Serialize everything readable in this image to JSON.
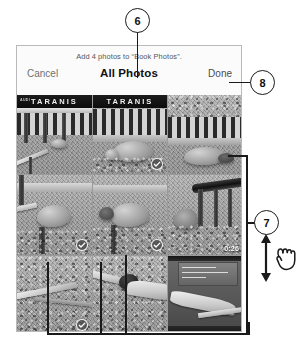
{
  "panel": {
    "nav": {
      "subtitle": "Add 4 photos to “Book Photos”.",
      "title": "All Photos",
      "cancel_label": "Cancel",
      "done_label": "Done"
    },
    "grid": {
      "rows": 3,
      "columns": 3,
      "cells": [
        {
          "id": "cell-1",
          "kind": "photo",
          "banner_text": "TARANIS",
          "banner_small": "AUDI",
          "selected": false,
          "duration": null
        },
        {
          "id": "cell-2",
          "kind": "photo",
          "banner_text": "TARANIS",
          "banner_small": "",
          "selected": true,
          "duration": null
        },
        {
          "id": "cell-3",
          "kind": "photo",
          "banner_text": "",
          "banner_small": "",
          "selected": false,
          "duration": null
        },
        {
          "id": "cell-4",
          "kind": "photo",
          "banner_text": "",
          "banner_small": "",
          "selected": true,
          "duration": null
        },
        {
          "id": "cell-5",
          "kind": "photo",
          "banner_text": "",
          "banner_small": "",
          "selected": true,
          "duration": null
        },
        {
          "id": "cell-6",
          "kind": "video",
          "banner_text": "",
          "banner_small": "",
          "selected": false,
          "duration": "0:26"
        },
        {
          "id": "cell-7",
          "kind": "photo",
          "banner_text": "",
          "banner_small": "",
          "selected": true,
          "duration": null
        },
        {
          "id": "cell-8",
          "kind": "photo",
          "banner_text": "",
          "banner_small": "",
          "selected": false,
          "duration": null
        },
        {
          "id": "cell-9",
          "kind": "photo",
          "banner_text": "",
          "banner_small": "",
          "selected": false,
          "duration": null
        }
      ]
    }
  },
  "annotations": {
    "callouts": [
      {
        "id": "callout-6",
        "label": "6",
        "target": "all-photos-title"
      },
      {
        "id": "callout-7",
        "label": "7",
        "target": "photo-grid-scroll"
      },
      {
        "id": "callout-8",
        "label": "8",
        "target": "done-button"
      }
    ],
    "gesture": {
      "name": "scroll-hand-icon",
      "direction": "vertical"
    }
  },
  "colors": {
    "ink": "#1a1a1a",
    "panel_border": "#b9b9b9",
    "nav_bg": "#fbfbfb",
    "title": "#111111",
    "muted_text": "#6f7175"
  }
}
